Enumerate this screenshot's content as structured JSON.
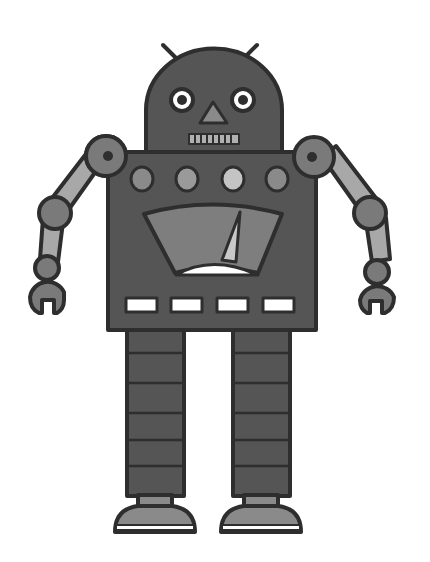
{
  "illustration": {
    "subject": "robot",
    "style": "grayscale cartoon",
    "colors": {
      "background": "#ffffff",
      "outline": "#2e2e2e",
      "body_dark": "#555555",
      "joint_mid": "#7a7a7a",
      "limb_light": "#a8a8a8",
      "button_light": "#b5b5b5",
      "white": "#ffffff"
    },
    "parts": {
      "antennae": 2,
      "eyes": 2,
      "mouth_teeth": 8,
      "chest_buttons": 4,
      "gauge_needle": 1,
      "chest_slots": 4,
      "arms": 2,
      "leg_segments_each": 6,
      "feet": 2
    }
  }
}
